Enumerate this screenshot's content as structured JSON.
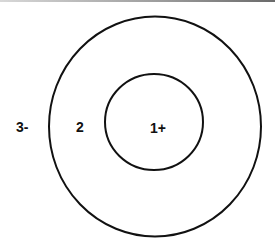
{
  "diagram": {
    "type": "concentric-zones",
    "stroke_color": "#111111",
    "background_color": "#ffffff",
    "circles": [
      {
        "name": "outer-circle"
      },
      {
        "name": "inner-circle"
      }
    ],
    "labels": {
      "outside": "3-",
      "middle": "2",
      "inner": "1+"
    }
  }
}
